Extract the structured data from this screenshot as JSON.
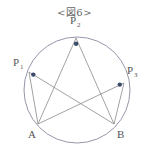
{
  "caption": "<図6>",
  "colors": {
    "line": "#8a8a8a",
    "circle": "#8a8aa0",
    "dot": "#3a4a6a",
    "text": "#555555"
  },
  "circle": {
    "cx": 77,
    "cy": 90,
    "r": 53
  },
  "points": {
    "P1": {
      "x": 29,
      "y": 72,
      "label": "P",
      "sub": "1",
      "lx": 13,
      "ly": 66
    },
    "P2": {
      "x": 76,
      "y": 38,
      "label": "P",
      "sub": "2",
      "lx": 70,
      "ly": 24
    },
    "P3": {
      "x": 124,
      "y": 83,
      "label": "P",
      "sub": "3",
      "lx": 127,
      "ly": 74
    },
    "A": {
      "x": 38,
      "y": 124,
      "label": "A",
      "lx": 28,
      "ly": 138
    },
    "B": {
      "x": 114,
      "y": 124,
      "label": "B",
      "lx": 117,
      "ly": 138
    }
  },
  "segments": [
    [
      "P1",
      "A"
    ],
    [
      "P1",
      "B"
    ],
    [
      "P2",
      "A"
    ],
    [
      "P2",
      "B"
    ],
    [
      "P3",
      "A"
    ],
    [
      "P3",
      "B"
    ]
  ],
  "dots": [
    "P1",
    "P2",
    "P3"
  ]
}
